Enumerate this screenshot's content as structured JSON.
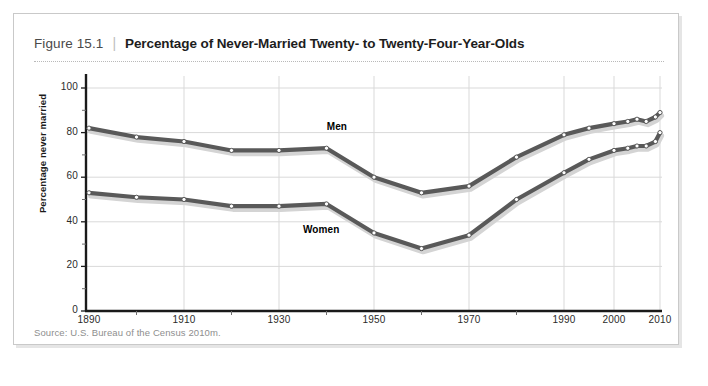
{
  "figure": {
    "number_label": "Figure 15.1",
    "separator": "|",
    "title": "Percentage of Never-Married Twenty- to Twenty-Four-Year-Olds",
    "source": "Source:  U.S. Bureau of the Census 2010m."
  },
  "colors": {
    "line": "#595959",
    "marker_fill": "#ffffff",
    "marker_stroke": "#4f4f4f",
    "shadow": "#d4d4d4",
    "grid": "#d9d9d9",
    "axis": "#1a1a1a",
    "frame_border": "#c9c9c9",
    "title_text": "#1d1d1d",
    "fig_num_text": "#4a4a4a",
    "source_text": "#8e8e8e"
  },
  "chart_data": {
    "type": "line",
    "title": "Percentage of Never-Married Twenty- to Twenty-Four-Year-Olds",
    "xlabel": "",
    "ylabel": "Percentage never married",
    "xlim": [
      1890,
      2010
    ],
    "ylim": [
      0,
      100
    ],
    "grid": true,
    "legend_position": "inline-annotation",
    "y_ticks": [
      0,
      20,
      40,
      60,
      80,
      100
    ],
    "y_tick_labels": [
      "0",
      "20",
      "40",
      "60",
      "80",
      "100"
    ],
    "y_minor_ticks": [
      10,
      30,
      50,
      70,
      90
    ],
    "x_ticks": [
      1890,
      1910,
      1930,
      1950,
      1970,
      1990,
      2000,
      2010
    ],
    "x_tick_labels": [
      "1890",
      "1910",
      "1930",
      "1950",
      "1970",
      "1990",
      "2000",
      "2010"
    ],
    "x_minor_ticks": [
      1900,
      1920,
      1940,
      1960,
      1980
    ],
    "annotations": [
      {
        "text": "Men",
        "x": 1943,
        "y": 82
      },
      {
        "text": "Women",
        "x": 1938,
        "y": 36
      }
    ],
    "series": [
      {
        "name": "Men",
        "x": [
          1890,
          1900,
          1910,
          1920,
          1930,
          1940,
          1950,
          1960,
          1970,
          1980,
          1990,
          1995,
          2000,
          2003,
          2005,
          2007,
          2009,
          2010
        ],
        "values": [
          82,
          78,
          76,
          72,
          72,
          73,
          60,
          53,
          56,
          69,
          79,
          82,
          84,
          85,
          86,
          85,
          87,
          89
        ]
      },
      {
        "name": "Women",
        "x": [
          1890,
          1900,
          1910,
          1920,
          1930,
          1940,
          1950,
          1960,
          1970,
          1980,
          1990,
          1995,
          2000,
          2003,
          2005,
          2007,
          2009,
          2010
        ],
        "values": [
          53,
          51,
          50,
          47,
          47,
          48,
          35,
          28,
          34,
          50,
          62,
          68,
          72,
          73,
          74,
          74,
          76,
          80
        ]
      }
    ]
  }
}
